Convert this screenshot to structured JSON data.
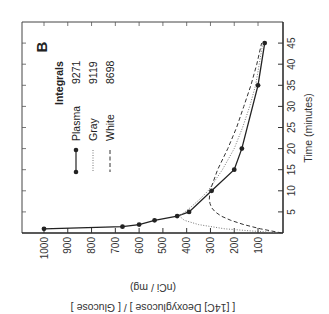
{
  "chart_data": {
    "type": "line",
    "orientation": "rotated 90° clockwise (value axis horizontal, reversed; time axis vertical)",
    "panel_label": "B",
    "xlabel": "Time (minutes)",
    "ylabel": "[ [14C] Deoxyglucose ] / [ Glucose ]",
    "ylabel_units": "(nCi / mg)",
    "xlim": [
      0,
      47
    ],
    "ylim": [
      0,
      1080
    ],
    "x_ticks": [
      5,
      10,
      15,
      20,
      25,
      30,
      35,
      40,
      45
    ],
    "y_ticks": [
      100,
      200,
      300,
      400,
      500,
      600,
      700,
      800,
      900,
      1000
    ],
    "grid": false,
    "legend_title": "Integrals",
    "series": [
      {
        "name": "Plasma",
        "integral": "9271",
        "style": "solid-with-markers",
        "x": [
          1,
          1.5,
          2,
          3,
          4,
          5,
          10,
          15,
          20,
          35,
          45
        ],
        "values": [
          1000,
          670,
          600,
          535,
          440,
          390,
          295,
          200,
          168,
          100,
          72
        ]
      },
      {
        "name": "Gray",
        "integral": "9119",
        "style": "dotted",
        "x": [
          0,
          0.5,
          1,
          2,
          3,
          4,
          6,
          8,
          10,
          15,
          20,
          25,
          30,
          35,
          40,
          45
        ],
        "values": [
          0,
          130,
          240,
          350,
          410,
          430,
          385,
          345,
          310,
          250,
          200,
          165,
          135,
          110,
          95,
          80
        ]
      },
      {
        "name": "White",
        "integral": "8698",
        "style": "dashed",
        "x": [
          0,
          1,
          2,
          3,
          4,
          5,
          6,
          7,
          8,
          10,
          15,
          20,
          25,
          30,
          35,
          40,
          45
        ],
        "values": [
          0,
          90,
          160,
          215,
          255,
          280,
          295,
          302,
          305,
          302,
          270,
          227,
          190,
          160,
          130,
          105,
          85
        ]
      }
    ],
    "legend": [
      {
        "label": "Plasma",
        "integral": "9271"
      },
      {
        "label": "Gray",
        "integral": "9119"
      },
      {
        "label": "White",
        "integral": "8698"
      }
    ]
  }
}
